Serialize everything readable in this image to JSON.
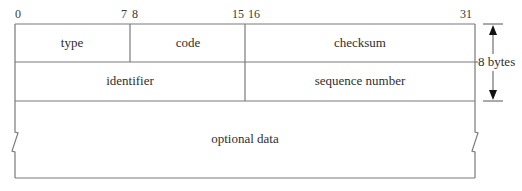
{
  "diagram": {
    "bit_labels": {
      "b0": "0",
      "b7": "7",
      "b8": "8",
      "b15": "15",
      "b16": "16",
      "b31": "31"
    },
    "rows": [
      {
        "fields": [
          {
            "name": "type",
            "bits": [
              0,
              7
            ]
          },
          {
            "name": "code",
            "bits": [
              8,
              15
            ]
          },
          {
            "name": "checksum",
            "bits": [
              16,
              31
            ]
          }
        ]
      },
      {
        "fields": [
          {
            "name": "identifier",
            "bits": [
              0,
              15
            ]
          },
          {
            "name": "sequence number",
            "bits": [
              16,
              31
            ]
          }
        ]
      },
      {
        "fields": [
          {
            "name": "optional data",
            "bits": [
              0,
              31
            ],
            "variable_length": true
          }
        ]
      }
    ],
    "fields": {
      "type": "type",
      "code": "code",
      "checksum": "checksum",
      "identifier": "identifier",
      "sequence_number": "sequence number",
      "optional_data": "optional data"
    },
    "size_annotation": "8 bytes"
  }
}
